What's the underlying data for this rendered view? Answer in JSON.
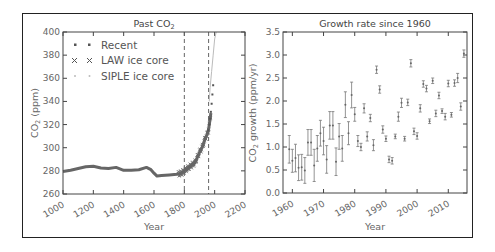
{
  "chart_data": [
    {
      "type": "line",
      "title": "Past CO₂",
      "xlabel": "Year",
      "ylabel": "CO₂ (ppm)",
      "xlim": [
        1000,
        2200
      ],
      "ylim": [
        260,
        400
      ],
      "xticks": [
        1000,
        1200,
        1400,
        1600,
        1800,
        2000,
        2200
      ],
      "yticks": [
        260,
        280,
        300,
        320,
        340,
        360,
        380,
        400
      ],
      "vlines": [
        1800,
        1960
      ],
      "legend_position": "upper left",
      "series": [
        {
          "name": "Recent",
          "marker": "square",
          "x": [
            1958,
            1965,
            1970,
            1975,
            1980,
            1985,
            1990
          ],
          "y": [
            315,
            320,
            325,
            331,
            338,
            346,
            354
          ]
        },
        {
          "name": "LAW ice core",
          "marker": "x",
          "x": [
            1000,
            1050,
            1100,
            1150,
            1200,
            1250,
            1300,
            1350,
            1400,
            1450,
            1500,
            1550,
            1580,
            1600,
            1620,
            1650,
            1700,
            1750,
            1780,
            1800,
            1820,
            1850,
            1870,
            1900,
            1920,
            1940,
            1950,
            1960,
            1970,
            1975
          ],
          "y": [
            279.5,
            280.5,
            282,
            283.5,
            284,
            282.5,
            282,
            283,
            280.5,
            280.5,
            281,
            283,
            281,
            278,
            275.5,
            276,
            276.5,
            277,
            278,
            280,
            282,
            285,
            287,
            296,
            301,
            309,
            311,
            316,
            325,
            330
          ]
        },
        {
          "name": "SIPLE ice core",
          "marker": "dot",
          "x": [
            1964,
            1970,
            1980,
            1990,
            2000,
            2010
          ],
          "y": [
            340,
            352,
            366,
            380,
            394,
            400
          ]
        }
      ]
    },
    {
      "type": "scatter",
      "title": "Growth rate since 1960",
      "xlabel": "Year",
      "ylabel": "CO₂ growth (ppm/yr)",
      "xlim": [
        1957,
        2016
      ],
      "ylim": [
        0.0,
        3.5
      ],
      "xticks": [
        1960,
        1970,
        1980,
        1990,
        2000,
        2010
      ],
      "yticks": [
        0.0,
        0.5,
        1.0,
        1.5,
        2.0,
        2.5,
        3.0,
        3.5
      ],
      "error_bars": true,
      "x": [
        1959,
        1960,
        1961,
        1962,
        1963,
        1964,
        1965,
        1966,
        1967,
        1968,
        1969,
        1970,
        1971,
        1972,
        1973,
        1974,
        1975,
        1976,
        1977,
        1978,
        1979,
        1980,
        1981,
        1982,
        1983,
        1984,
        1985,
        1986,
        1987,
        1988,
        1989,
        1990,
        1991,
        1992,
        1993,
        1994,
        1995,
        1996,
        1997,
        1998,
        1999,
        2000,
        2001,
        2002,
        2003,
        2004,
        2005,
        2006,
        2007,
        2008,
        2009,
        2010,
        2011,
        2012,
        2013,
        2014,
        2015
      ],
      "y": [
        0.95,
        0.7,
        0.76,
        0.55,
        0.56,
        0.49,
        1.1,
        1.1,
        0.6,
        0.97,
        1.3,
        1.13,
        0.73,
        1.47,
        1.47,
        0.68,
        1.23,
        0.97,
        1.92,
        1.3,
        2.13,
        1.71,
        1.13,
        1.0,
        1.84,
        1.23,
        1.63,
        1.04,
        2.68,
        2.25,
        1.38,
        1.18,
        0.73,
        0.7,
        1.23,
        1.66,
        1.96,
        1.18,
        1.97,
        2.82,
        1.34,
        1.24,
        1.84,
        2.37,
        2.27,
        1.56,
        2.44,
        1.73,
        2.12,
        1.78,
        1.66,
        2.38,
        1.7,
        2.39,
        2.5,
        1.88,
        3.03
      ],
      "err": [
        0.3,
        0.25,
        0.3,
        0.28,
        0.28,
        0.28,
        0.28,
        0.28,
        0.35,
        0.28,
        0.28,
        0.3,
        0.3,
        0.3,
        0.3,
        0.3,
        0.28,
        0.28,
        0.28,
        0.25,
        0.28,
        0.15,
        0.12,
        0.08,
        0.1,
        0.1,
        0.08,
        0.12,
        0.08,
        0.08,
        0.08,
        0.06,
        0.07,
        0.07,
        0.05,
        0.1,
        0.1,
        0.05,
        0.07,
        0.08,
        0.07,
        0.07,
        0.08,
        0.07,
        0.07,
        0.05,
        0.06,
        0.07,
        0.07,
        0.05,
        0.07,
        0.07,
        0.05,
        0.07,
        0.1,
        0.08,
        0.08
      ]
    }
  ],
  "left": {
    "title_main": "Past CO",
    "title_sub": "2",
    "ylabel_main": "CO",
    "ylabel_sub": "2",
    "ylabel_rest": " (ppm)",
    "xlabel": "Year",
    "legend": [
      "Recent",
      "LAW ice core",
      "SIPLE ice core"
    ]
  },
  "right": {
    "title": "Growth rate since 1960",
    "ylabel_main": "CO",
    "ylabel_sub": "2",
    "ylabel_rest": " growth (ppm/yr)",
    "xlabel": "Year"
  },
  "colors": {
    "data": "#666666",
    "siple": "#bbbbbb",
    "axis": "#444444",
    "frame": "#222222"
  }
}
